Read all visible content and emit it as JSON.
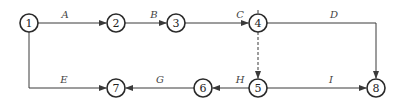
{
  "diagram": {
    "type": "activity-network",
    "nodes": [
      {
        "id": "1",
        "label": "1",
        "x": 29,
        "y": 23
      },
      {
        "id": "2",
        "label": "2",
        "x": 116,
        "y": 23
      },
      {
        "id": "3",
        "label": "3",
        "x": 176,
        "y": 23
      },
      {
        "id": "4",
        "label": "4",
        "x": 258,
        "y": 23
      },
      {
        "id": "5",
        "label": "5",
        "x": 258,
        "y": 88
      },
      {
        "id": "6",
        "label": "6",
        "x": 203,
        "y": 88
      },
      {
        "id": "7",
        "label": "7",
        "x": 116,
        "y": 88
      },
      {
        "id": "8",
        "label": "8",
        "x": 376,
        "y": 88
      }
    ],
    "edges": [
      {
        "label": "A",
        "from": "1",
        "to": "2",
        "style": "solid"
      },
      {
        "label": "B",
        "from": "2",
        "to": "3",
        "style": "solid"
      },
      {
        "label": "C",
        "from": "3",
        "to": "4",
        "style": "solid"
      },
      {
        "label": "D",
        "from": "4",
        "to": "8",
        "style": "solid"
      },
      {
        "label": "E",
        "from": "1",
        "to": "7",
        "style": "solid"
      },
      {
        "label": "G",
        "from": "6",
        "to": "7",
        "style": "solid"
      },
      {
        "label": "H",
        "from": "5",
        "to": "6",
        "style": "solid"
      },
      {
        "label": "I",
        "from": "5",
        "to": "8",
        "style": "solid"
      },
      {
        "label": "",
        "from": "4",
        "to": "5",
        "style": "dashed"
      }
    ]
  }
}
